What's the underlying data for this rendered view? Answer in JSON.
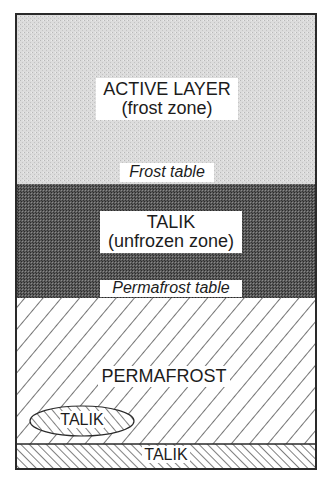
{
  "diagram": {
    "type": "soil-profile",
    "colors": {
      "active_layer_fill": "#d9d9d9",
      "talik_fill": "#4a4a4a",
      "permafrost_fill": "#ffffff",
      "hatch": "#2a2a2a",
      "border": "#2a2a2a"
    },
    "layers": [
      {
        "name": "active-layer",
        "title": "ACTIVE LAYER",
        "subtitle": "(frost zone)",
        "pattern": "light-stipple"
      },
      {
        "name": "talik-zone",
        "title": "TALIK",
        "subtitle": "(unfrozen zone)",
        "pattern": "dark-stipple"
      },
      {
        "name": "permafrost",
        "title": "PERMAFROST",
        "pattern": "diagonal-hatch-forward"
      },
      {
        "name": "talik-bottom",
        "title": "TALIK",
        "pattern": "diagonal-hatch-back"
      }
    ],
    "boundaries": {
      "frost_table": "Frost table",
      "permafrost_table": "Permafrost table"
    },
    "lens": {
      "title": "TALIK",
      "pattern": "diagonal-hatch-back"
    }
  }
}
